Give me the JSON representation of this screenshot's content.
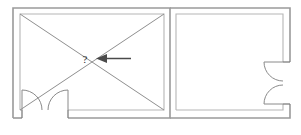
{
  "drawing": {
    "title": "Floor plan sketch",
    "kind": "architectural-floor-plan",
    "stroke_color": "#9a9a9a",
    "inner_stroke_color": "#b6b6b6",
    "annotation_color": "#4a4a4a",
    "background_color": "#ffffff"
  },
  "annotations": {
    "question_mark": "?",
    "arrow": {
      "name": "pointer-arrow",
      "direction": "left",
      "tail_x": 131,
      "tail_y": 58,
      "tip_x": 97,
      "tip_y": 58
    }
  },
  "rooms": [
    {
      "id": "left-room",
      "label": "",
      "outer": {
        "x": 13,
        "y": 8,
        "width": 157,
        "height": 110
      },
      "inner": {
        "x": 20,
        "y": 14,
        "width": 144,
        "height": 96
      },
      "has_diagonals": true
    },
    {
      "id": "right-room",
      "label": "",
      "outer": {
        "x": 170,
        "y": 8,
        "width": 120,
        "height": 110
      },
      "inner": {
        "x": 176,
        "y": 14,
        "width": 107,
        "height": 96
      },
      "has_diagonals": false
    }
  ],
  "doors": [
    {
      "id": "door-bottom-left",
      "name": "double-door-bottom",
      "wall": "bottom",
      "leaves": 2,
      "opening_start": 22,
      "opening_end": 68,
      "swing": "inward"
    },
    {
      "id": "door-right-wall",
      "name": "double-door-right",
      "wall": "right",
      "leaves": 2,
      "opening_start": 62,
      "opening_end": 104,
      "swing": "inward"
    }
  ]
}
